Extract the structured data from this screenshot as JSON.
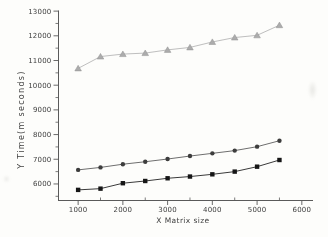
{
  "chart_data": {
    "type": "line",
    "title": "",
    "xlabel": "X Matrix size",
    "ylabel": "Y Time(m seconds)",
    "x": [
      1000,
      1500,
      2000,
      2500,
      3000,
      3500,
      4000,
      4500,
      5000,
      5500
    ],
    "x_ticks": [
      1000,
      2000,
      3000,
      4000,
      5000,
      6000
    ],
    "y_ticks": [
      6000,
      7000,
      8000,
      9000,
      10000,
      11000,
      12000,
      13000
    ],
    "minor_tick_step": 500,
    "xlim": [
      550,
      6250
    ],
    "ylim": [
      5330,
      13025
    ],
    "grid": false,
    "legend": "none",
    "series": [
      {
        "name": "upper-series",
        "marker": "triangle",
        "line_color": "#b7b7b7",
        "marker_color": "#acacac",
        "values": [
          10680,
          11160,
          11260,
          11300,
          11430,
          11530,
          11750,
          11930,
          12020,
          12430
        ]
      },
      {
        "name": "middle-series",
        "marker": "circle",
        "line_color": "#6e6e6e",
        "marker_color": "#3d3d3d",
        "values": [
          6570,
          6670,
          6800,
          6900,
          7010,
          7130,
          7240,
          7350,
          7510,
          7750
        ]
      },
      {
        "name": "lower-series",
        "marker": "square",
        "line_color": "#3a3a3a",
        "marker_color": "#161616",
        "values": [
          5760,
          5810,
          6030,
          6120,
          6230,
          6300,
          6390,
          6500,
          6700,
          6970
        ]
      }
    ]
  },
  "colors": {
    "axis": "#5a5a5a",
    "text": "#414141",
    "background": "#fdfdfb"
  }
}
